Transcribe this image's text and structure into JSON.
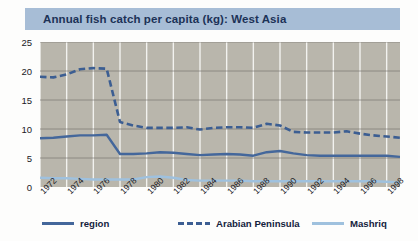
{
  "title": "Annual fish catch per capita (kg): West Asia",
  "colors": {
    "title_bar": "#a7bdd6",
    "title_text": "#1c3257",
    "plot_background": "#b9b6ac",
    "gridline_horizontal": "#6e6d68",
    "gridline_vertical": "#f2f2ef",
    "region": "#44679b",
    "arabian_peninsula": "#3c5e92",
    "mashriq": "#9fc1de"
  },
  "legend": {
    "position": "bottom",
    "items": [
      {
        "label": "region",
        "style": "solid-dark",
        "color": "#44679b"
      },
      {
        "label": "Arabian Peninsula",
        "style": "dashed-dark",
        "color": "#3c5e92"
      },
      {
        "label": "Mashriq",
        "style": "solid-light",
        "color": "#9fc1de"
      }
    ]
  },
  "axes": {
    "y_ticks": [
      "0",
      "5",
      "10",
      "15",
      "20",
      "25"
    ],
    "x_ticks": [
      "1972",
      "1974",
      "1976",
      "1978",
      "1980",
      "1982",
      "1984",
      "1986",
      "1988",
      "1990",
      "1992",
      "1994",
      "1996",
      "1998"
    ]
  },
  "chart_data": {
    "type": "line",
    "title": "Annual fish catch per capita (kg): West Asia",
    "xlabel": "",
    "ylabel": "",
    "ylim": [
      0,
      25
    ],
    "xlim": [
      1972,
      1999
    ],
    "grid": true,
    "legend_position": "bottom",
    "yticks": [
      0,
      5,
      10,
      15,
      20,
      25
    ],
    "xticks": [
      1972,
      1974,
      1976,
      1978,
      1980,
      1982,
      1984,
      1986,
      1988,
      1990,
      1992,
      1994,
      1996,
      1998
    ],
    "x": [
      1972,
      1973,
      1974,
      1975,
      1976,
      1977,
      1978,
      1979,
      1980,
      1981,
      1982,
      1983,
      1984,
      1985,
      1986,
      1987,
      1988,
      1989,
      1990,
      1991,
      1992,
      1993,
      1994,
      1995,
      1996,
      1997,
      1998,
      1999
    ],
    "series": [
      {
        "name": "region",
        "style": "solid",
        "color": "#44679b",
        "values": [
          8.4,
          8.5,
          8.7,
          8.9,
          8.9,
          9.0,
          5.7,
          5.7,
          5.8,
          6.0,
          5.9,
          5.7,
          5.5,
          5.6,
          5.7,
          5.6,
          5.4,
          6.0,
          6.2,
          5.8,
          5.5,
          5.4,
          5.4,
          5.4,
          5.4,
          5.4,
          5.4,
          5.2
        ]
      },
      {
        "name": "Arabian Peninsula",
        "style": "dashed",
        "color": "#3c5e92",
        "values": [
          19.0,
          18.9,
          19.4,
          20.3,
          20.5,
          20.4,
          11.2,
          10.6,
          10.2,
          10.2,
          10.2,
          10.3,
          9.9,
          10.2,
          10.3,
          10.3,
          10.2,
          10.9,
          10.6,
          9.5,
          9.4,
          9.4,
          9.4,
          9.6,
          9.2,
          8.9,
          8.7,
          8.5
        ]
      },
      {
        "name": "Mashriq",
        "style": "solid",
        "color": "#9fc1de",
        "values": [
          1.6,
          1.5,
          1.5,
          1.4,
          1.3,
          1.3,
          1.3,
          1.3,
          1.7,
          1.8,
          1.6,
          1.2,
          1.1,
          1.1,
          1.1,
          1.1,
          1.0,
          1.0,
          1.0,
          1.0,
          1.0,
          1.0,
          1.0,
          1.0,
          1.0,
          1.0,
          0.9,
          0.8
        ]
      }
    ]
  }
}
